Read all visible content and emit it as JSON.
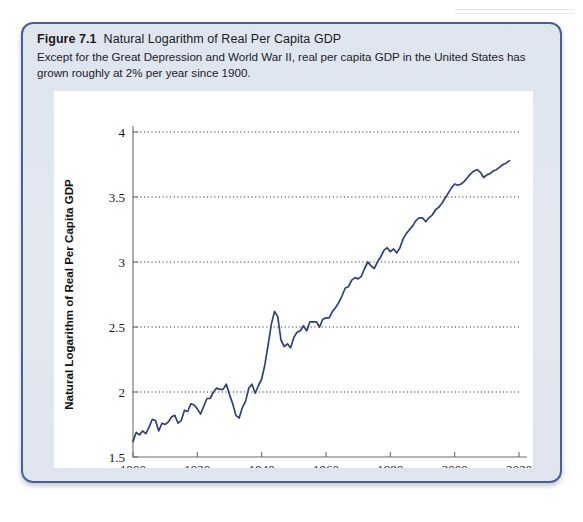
{
  "page": {
    "background_color": "#ffffff",
    "header_rule": "page-header-rule"
  },
  "figure": {
    "number": "Figure 7.1",
    "title": "Natural Logarithm of Real Per Capita GDP",
    "subtitle": "Except for the Great Depression and World War II, real per capita GDP in the United States has grown roughly at 2% per year since 1900.",
    "border_color": "#4a5f93",
    "background_color": "#e1e6f0"
  },
  "chart_data": {
    "type": "line",
    "title": "Natural Logarithm of Real Per Capita GDP",
    "xlabel": "Year",
    "ylabel": "Natural Logarithm of Real Per Capita GDP",
    "xlim": [
      1900,
      2020
    ],
    "ylim": [
      1.5,
      4.0
    ],
    "xticks": [
      1900,
      1920,
      1940,
      1960,
      1980,
      2000,
      2020
    ],
    "xticklabels": [
      "1900",
      "1920",
      "1940",
      "1960",
      "1980",
      "2000",
      "2020"
    ],
    "yticks": [
      1.5,
      2.0,
      2.5,
      3.0,
      3.5,
      4.0
    ],
    "yticklabels": [
      "1.5",
      "2",
      "2.5",
      "3",
      "3.5",
      "4"
    ],
    "grid": "horizontal-dotted",
    "gridlines_at": [
      2.0,
      2.5,
      3.0,
      3.5,
      4.0
    ],
    "legend": "none",
    "line_color": "#32407a",
    "series": [
      {
        "name": "Natural Logarithm of Real Per Capita GDP",
        "x": [
          1900,
          1901,
          1902,
          1903,
          1904,
          1905,
          1906,
          1907,
          1908,
          1909,
          1910,
          1911,
          1912,
          1913,
          1914,
          1915,
          1916,
          1917,
          1918,
          1919,
          1920,
          1921,
          1922,
          1923,
          1924,
          1925,
          1926,
          1927,
          1928,
          1929,
          1930,
          1931,
          1932,
          1933,
          1934,
          1935,
          1936,
          1937,
          1938,
          1939,
          1940,
          1941,
          1942,
          1943,
          1944,
          1945,
          1946,
          1947,
          1948,
          1949,
          1950,
          1951,
          1952,
          1953,
          1954,
          1955,
          1956,
          1957,
          1958,
          1959,
          1960,
          1961,
          1962,
          1963,
          1964,
          1965,
          1966,
          1967,
          1968,
          1969,
          1970,
          1971,
          1972,
          1973,
          1974,
          1975,
          1976,
          1977,
          1978,
          1979,
          1980,
          1981,
          1982,
          1983,
          1984,
          1985,
          1986,
          1987,
          1988,
          1989,
          1990,
          1991,
          1992,
          1993,
          1994,
          1995,
          1996,
          1997,
          1998,
          1999,
          2000,
          2001,
          2002,
          2003,
          2004,
          2005,
          2006,
          2007,
          2008,
          2009,
          2010,
          2011,
          2012,
          2013,
          2014,
          2015,
          2016,
          2017
        ],
        "values": [
          1.62,
          1.69,
          1.67,
          1.7,
          1.68,
          1.73,
          1.79,
          1.78,
          1.7,
          1.76,
          1.75,
          1.77,
          1.81,
          1.82,
          1.76,
          1.78,
          1.86,
          1.85,
          1.91,
          1.9,
          1.87,
          1.83,
          1.89,
          1.95,
          1.95,
          2.0,
          2.03,
          2.02,
          2.02,
          2.06,
          1.98,
          1.91,
          1.82,
          1.8,
          1.88,
          1.93,
          2.03,
          2.06,
          1.99,
          2.05,
          2.1,
          2.21,
          2.36,
          2.52,
          2.62,
          2.58,
          2.4,
          2.35,
          2.37,
          2.34,
          2.42,
          2.46,
          2.47,
          2.51,
          2.47,
          2.54,
          2.54,
          2.54,
          2.5,
          2.56,
          2.57,
          2.57,
          2.62,
          2.65,
          2.69,
          2.74,
          2.8,
          2.81,
          2.86,
          2.88,
          2.87,
          2.89,
          2.95,
          3.0,
          2.97,
          2.95,
          3.0,
          3.04,
          3.09,
          3.11,
          3.08,
          3.1,
          3.07,
          3.11,
          3.18,
          3.22,
          3.25,
          3.28,
          3.32,
          3.34,
          3.34,
          3.31,
          3.34,
          3.36,
          3.4,
          3.42,
          3.45,
          3.49,
          3.53,
          3.57,
          3.6,
          3.59,
          3.6,
          3.62,
          3.65,
          3.68,
          3.7,
          3.71,
          3.69,
          3.65,
          3.67,
          3.68,
          3.7,
          3.71,
          3.73,
          3.75,
          3.76,
          3.78
        ]
      }
    ]
  }
}
